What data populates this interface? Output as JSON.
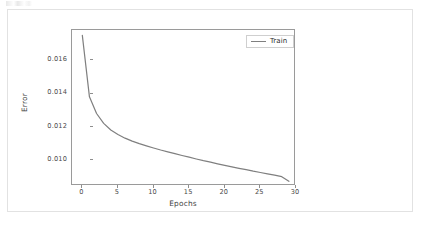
{
  "figure": {
    "background_color": "#ffffff",
    "frame_border_color": "#e2e2e2",
    "axes_border_color": "#9a9a9a"
  },
  "chart_data": {
    "type": "line",
    "title": "",
    "xlabel": "Epochs",
    "ylabel": "Error",
    "xlim": [
      -1.45,
      30.0
    ],
    "ylim": [
      0.00846,
      0.01782
    ],
    "grid": false,
    "legend_position": "upper right",
    "line_color": "#7f7f7f",
    "line_width": 1.2,
    "xticks": [
      0,
      5,
      10,
      15,
      20,
      25,
      30
    ],
    "xtick_labels": [
      "0",
      "5",
      "10",
      "15",
      "20",
      "25",
      "30"
    ],
    "yticks": [
      0.01,
      0.012,
      0.014,
      0.016
    ],
    "ytick_labels": [
      "0.010",
      "0.012",
      "0.014",
      "0.016"
    ],
    "series": [
      {
        "name": "Train",
        "x": [
          0,
          1,
          2,
          3,
          4,
          5,
          6,
          7,
          8,
          9,
          10,
          11,
          12,
          13,
          14,
          15,
          16,
          17,
          18,
          19,
          20,
          21,
          22,
          23,
          24,
          25,
          26,
          27,
          28,
          29
        ],
        "values": [
          0.0175,
          0.01381,
          0.01281,
          0.01222,
          0.01182,
          0.01155,
          0.01133,
          0.01115,
          0.011,
          0.01087,
          0.01074,
          0.01062,
          0.01051,
          0.0104,
          0.01029,
          0.01019,
          0.01008,
          0.00998,
          0.00989,
          0.00979,
          0.0097,
          0.00961,
          0.00952,
          0.00944,
          0.00935,
          0.00927,
          0.00919,
          0.00911,
          0.00902,
          0.00874
        ]
      }
    ]
  },
  "legend": {
    "entries": [
      {
        "label": "Train",
        "color": "#7f7f7f"
      }
    ]
  }
}
